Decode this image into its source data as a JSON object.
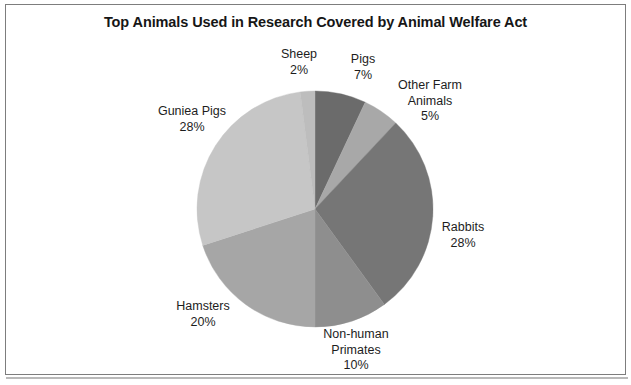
{
  "chart_data": {
    "type": "pie",
    "title": "Top Animals Used in Research Covered by Animal Welfare Act",
    "xlabel": "",
    "ylabel": "",
    "legend_position": "none",
    "grid": false,
    "value_suffix": "%",
    "start_angle_deg": 0,
    "direction": "clockwise",
    "categories": [
      "Pigs",
      "Other Farm Animals",
      "Rabbits",
      "Non-human Primates",
      "Hamsters",
      "Guniea Pigs",
      "Sheep"
    ],
    "values": [
      7,
      5,
      28,
      10,
      20,
      28,
      2
    ],
    "slices": [
      {
        "label": "Pigs",
        "value": 7,
        "pct_text": "7%",
        "color": "#6b6b6b"
      },
      {
        "label": "Other Farm Animals",
        "value": 5,
        "pct_text": "5%",
        "color": "#a8a8a8"
      },
      {
        "label": "Rabbits",
        "value": 28,
        "pct_text": "28%",
        "color": "#767676"
      },
      {
        "label": "Non-human Primates",
        "value": 10,
        "pct_text": "10%",
        "color": "#8e8e8e"
      },
      {
        "label": "Hamsters",
        "value": 20,
        "pct_text": "20%",
        "color": "#a6a6a6"
      },
      {
        "label": "Guniea Pigs",
        "value": 28,
        "pct_text": "28%",
        "color": "#c6c6c6"
      },
      {
        "label": "Sheep",
        "value": 2,
        "pct_text": "2%",
        "color": "#bdbdbd"
      }
    ]
  },
  "labels": {
    "sheep": {
      "name": "Sheep",
      "pct": "2%"
    },
    "pigs": {
      "name": "Pigs",
      "pct": "7%"
    },
    "other": {
      "name": "Other Farm",
      "name2": "Animals",
      "pct": "5%"
    },
    "rabbits": {
      "name": "Rabbits",
      "pct": "28%"
    },
    "nonhuman": {
      "name": "Non-human",
      "name2": "Primates",
      "pct": "10%"
    },
    "hamsters": {
      "name": "Hamsters",
      "pct": "20%"
    },
    "guinea": {
      "name": "Guniea Pigs",
      "pct": "28%"
    }
  }
}
